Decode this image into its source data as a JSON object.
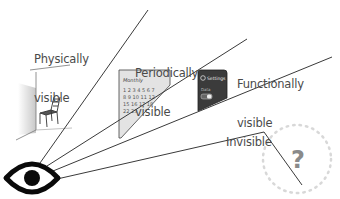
{
  "diagram": {
    "observer": {
      "icon": "eye-icon"
    },
    "regions": [
      {
        "id": "physically",
        "label_line1": "Physically",
        "label_line2": "visible",
        "illustration": "chair-in-room-corner"
      },
      {
        "id": "periodically",
        "label_line1": "Periodically",
        "label_line2": "visible",
        "illustration": "monthly-calendar"
      },
      {
        "id": "functionally",
        "label_line1": "Functionally",
        "label_line2": "visible",
        "illustration": "settings-phone"
      },
      {
        "id": "invisible",
        "label_line1": "Invisible",
        "illustration": "question-mark-in-dotted-circle"
      }
    ],
    "calendar": {
      "title": "Monthly",
      "row1": "1 2 3 4 5 6 7",
      "row2": "8 9 10 11 12",
      "row3": "15 16 17 18",
      "row4": "22 23"
    },
    "phone": {
      "header": "Settings",
      "row_label": "Data"
    },
    "unknown_symbol": "?",
    "colors": {
      "line": "#3a3a3a",
      "text": "#4a4a4a",
      "eye": "#0a0a0a",
      "phone": "#3b3b3b",
      "calendar_bg": "#e2e2e2",
      "dots": "#d8d8d8",
      "question": "#8a8a8a"
    }
  }
}
